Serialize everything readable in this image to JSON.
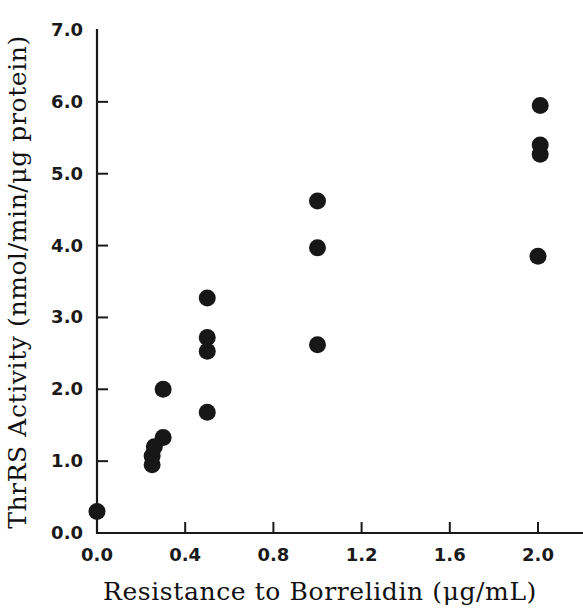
{
  "chart_data": {
    "type": "scatter",
    "title": "",
    "xlabel": "Resistance to Borrelidin  (μg/mL)",
    "ylabel": "ThrRS Activity (nmol/min/μg protein)",
    "xlim": [
      0.0,
      2.2
    ],
    "ylim": [
      0.0,
      7.0
    ],
    "xticks": [
      "0.0",
      "0.4",
      "0.8",
      "1.2",
      "1.6",
      "2.0"
    ],
    "xtick_values": [
      0.0,
      0.4,
      0.8,
      1.2,
      1.6,
      2.0
    ],
    "yticks": [
      "0.0",
      "1.0",
      "2.0",
      "3.0",
      "4.0",
      "5.0",
      "6.0",
      "7.0"
    ],
    "ytick_values": [
      0.0,
      1.0,
      2.0,
      3.0,
      4.0,
      5.0,
      6.0,
      7.0
    ],
    "grid": false,
    "legend": null,
    "marker": "filled-circle",
    "marker_color": "#171717",
    "marker_size_px": 17,
    "points": [
      {
        "x": 0.0,
        "y": 0.3
      },
      {
        "x": 0.25,
        "y": 0.95
      },
      {
        "x": 0.25,
        "y": 1.07
      },
      {
        "x": 0.26,
        "y": 1.2
      },
      {
        "x": 0.3,
        "y": 1.33
      },
      {
        "x": 0.3,
        "y": 2.0
      },
      {
        "x": 0.5,
        "y": 1.68
      },
      {
        "x": 0.5,
        "y": 2.53
      },
      {
        "x": 0.5,
        "y": 2.72
      },
      {
        "x": 0.5,
        "y": 3.27
      },
      {
        "x": 1.0,
        "y": 2.62
      },
      {
        "x": 1.0,
        "y": 3.97
      },
      {
        "x": 1.0,
        "y": 4.62
      },
      {
        "x": 2.0,
        "y": 3.85
      },
      {
        "x": 2.01,
        "y": 5.27
      },
      {
        "x": 2.01,
        "y": 5.4
      },
      {
        "x": 2.01,
        "y": 5.95
      }
    ]
  },
  "axes": {
    "x_axis_label": "Resistance to Borrelidin  (μg/mL)",
    "y_axis_label": "ThrRS Activity (nmol/min/μg protein)"
  },
  "colors": {
    "marker": "#171717",
    "axis": "#1a1a1a",
    "background": "#ffffff"
  }
}
